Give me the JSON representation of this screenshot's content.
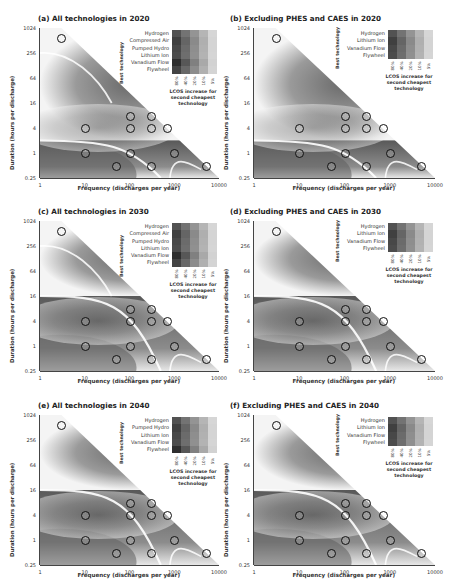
{
  "chart_data": [
    {
      "type": "heatmap",
      "title": "(a) All technologies in 2020",
      "xlabel": "Frequency (discharges per year)",
      "ylabel": "Duration (hours per discharge)",
      "xscale": "log",
      "yscale": "log2",
      "xlim": [
        1,
        10000
      ],
      "ylim": [
        0.25,
        1024
      ],
      "xticks": [
        "1",
        "10",
        "100",
        "1000",
        "10000"
      ],
      "yticks": [
        "0.25",
        "1",
        "4",
        "16",
        "64",
        "256",
        "1024"
      ],
      "legend": {
        "title": "Best technology",
        "technologies": [
          "Hydrogen",
          "Compressed Air",
          "Pumped Hydro",
          "Lithium Ion",
          "Vanadium Flow",
          "Flywheel"
        ],
        "scale_label": "LCOS increase for second cheapest technology",
        "scale_ticks": [
          "80%",
          "40%",
          "20%",
          "10%",
          "5%"
        ]
      },
      "markers": 12
    },
    {
      "type": "heatmap",
      "title": "(b) Excluding PHES and CAES in 2020",
      "xlabel": "Frequency (discharges per year)",
      "ylabel": "Duration (hours per discharge)",
      "xlim": [
        1,
        10000
      ],
      "ylim": [
        0.25,
        1024
      ],
      "legend": {
        "title": "Best technology",
        "technologies": [
          "Hydrogen",
          "Lithium Ion",
          "Vanadium Flow",
          "Flywheel"
        ],
        "scale_label": "LCOS increase for second cheapest technology",
        "scale_ticks": [
          "80%",
          "40%",
          "20%",
          "10%",
          "5%"
        ]
      },
      "markers": 13
    },
    {
      "type": "heatmap",
      "title": "(c) All technologies in 2030",
      "xlabel": "Frequency (discharges per year)",
      "ylabel": "Duration (hours per discharge)",
      "xlim": [
        1,
        10000
      ],
      "ylim": [
        0.25,
        1024
      ],
      "legend": {
        "title": "Best technology",
        "technologies": [
          "Hydrogen",
          "Compressed Air",
          "Pumped Hydro",
          "Lithium Ion",
          "Vanadium Flow",
          "Flywheel"
        ],
        "scale_label": "LCOS increase for second cheapest technology",
        "scale_ticks": [
          "80%",
          "40%",
          "20%",
          "10%",
          "5%"
        ]
      },
      "markers": 12
    },
    {
      "type": "heatmap",
      "title": "(d) Excluding PHES and CAES in 2030",
      "xlabel": "Frequency (discharges per year)",
      "ylabel": "Duration (hours per discharge)",
      "xlim": [
        1,
        10000
      ],
      "ylim": [
        0.25,
        1024
      ],
      "legend": {
        "title": "Best technology",
        "technologies": [
          "Hydrogen",
          "Lithium Ion",
          "Vanadium Flow",
          "Flywheel"
        ],
        "scale_label": "LCOS increase for second cheapest technology",
        "scale_ticks": [
          "80%",
          "40%",
          "20%",
          "10%",
          "5%"
        ]
      },
      "markers": 12
    },
    {
      "type": "heatmap",
      "title": "(e) All technologies in 2040",
      "xlabel": "Frequency (discharges per year)",
      "ylabel": "Duration (hours per discharge)",
      "xlim": [
        1,
        10000
      ],
      "ylim": [
        0.25,
        1024
      ],
      "legend": {
        "title": "Best technology",
        "technologies": [
          "Hydrogen",
          "Pumped Hydro",
          "Lithium Ion",
          "Vanadium Flow",
          "Flywheel"
        ],
        "scale_label": "LCOS increase for second cheapest technology",
        "scale_ticks": [
          "80%",
          "40%",
          "20%",
          "10%",
          "5%"
        ]
      },
      "markers": 12
    },
    {
      "type": "heatmap",
      "title": "(f) Excluding PHES and CAES in 2040",
      "xlabel": "Frequency (discharges per year)",
      "ylabel": "Duration (hours per discharge)",
      "xlim": [
        1,
        10000
      ],
      "ylim": [
        0.25,
        1024
      ],
      "legend": {
        "title": "Best technology",
        "technologies": [
          "Hydrogen",
          "Lithium Ion",
          "Vanadium Flow",
          "Flywheel"
        ],
        "scale_label": "LCOS increase for second cheapest technology",
        "scale_ticks": [
          "80%",
          "40%",
          "20%",
          "10%",
          "5%"
        ]
      },
      "markers": 12
    }
  ],
  "panels": [
    {
      "title": "(a) All technologies in 2020"
    },
    {
      "title": "(b) Excluding PHES and CAES in 2020"
    },
    {
      "title": "(c) All technologies in 2030"
    },
    {
      "title": "(d) Excluding PHES and CAES in 2030"
    },
    {
      "title": "(e) All technologies in 2040"
    },
    {
      "title": "(f) Excluding PHES and CAES in 2040"
    }
  ],
  "axes": {
    "xlabel": "Frequency (discharges per year)",
    "ylabel": "Duration (hours per discharge)",
    "xticks": [
      "1",
      "10",
      "100",
      "1000",
      "10000"
    ],
    "yticks": [
      "1024",
      "256",
      "64",
      "16",
      "4",
      "1",
      "0.25"
    ]
  },
  "legend": {
    "best": "Best technology",
    "caption_1": "LCOS increase for",
    "caption_2": "second cheapest",
    "caption_3": "technology",
    "ticks": [
      "80%",
      "40%",
      "20%",
      "10%",
      "5%"
    ],
    "six": [
      "Hydrogen",
      "Compressed Air",
      "Pumped Hydro",
      "Lithium Ion",
      "Vanadium Flow",
      "Flywheel"
    ],
    "four": [
      "Hydrogen",
      "Lithium Ion",
      "Vanadium Flow",
      "Flywheel"
    ],
    "five": [
      "Hydrogen",
      "Pumped Hydro",
      "Lithium Ion",
      "Vanadium Flow",
      "Flywheel"
    ]
  }
}
